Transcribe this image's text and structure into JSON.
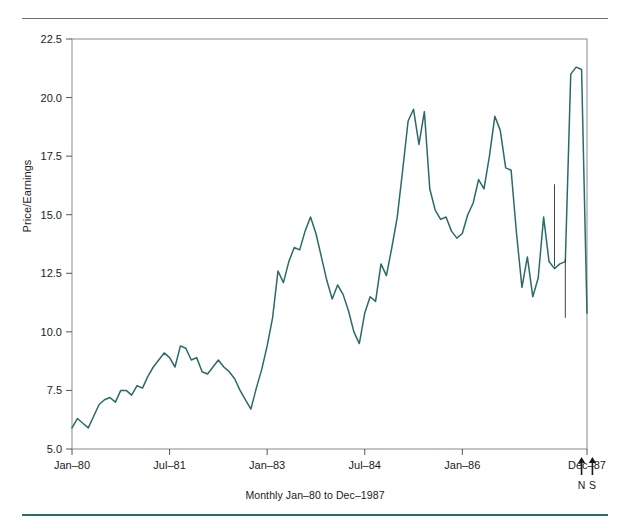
{
  "figure": {
    "top_text_remnant": "",
    "caption": "Monthly Jan–80 to Dec–1987",
    "accent_color": "#2a6f6c",
    "line_color": "#2a6b68",
    "rule_color": "#6e6e6e"
  },
  "axes": {
    "ylabel": "Price/Earnings",
    "yticks": [
      "5.0",
      "7.5",
      "10.0",
      "12.5",
      "15.0",
      "17.5",
      "20.0",
      "22.5"
    ],
    "xticks": [
      "Jan–80",
      "Jul–81",
      "Jan–83",
      "Jul–84",
      "Jan–86",
      "Dec–87"
    ]
  },
  "annotations": [
    {
      "name": "arrow-n",
      "label": "N",
      "x_value": 94
    },
    {
      "name": "arrow-s",
      "label": "S",
      "x_value": 96
    }
  ],
  "chart_data": {
    "type": "line",
    "title": "",
    "subtitle": "",
    "xlabel": "Monthly Jan–80 to Dec–1987",
    "ylabel": "Price/Earnings",
    "ylim": [
      5.0,
      22.5
    ],
    "yticks": [
      5.0,
      7.5,
      10.0,
      12.5,
      15.0,
      17.5,
      20.0,
      22.5
    ],
    "grid": false,
    "legend": "none",
    "x_tick_labels": [
      "Jan–80",
      "Jul–81",
      "Jan–83",
      "Jul–84",
      "Jan–86",
      "Dec–87"
    ],
    "x_tick_indices": [
      0,
      18,
      36,
      54,
      72,
      95
    ],
    "x_start": "Jan-1980",
    "x_end": "Dec-1987",
    "n_points": 96,
    "series": [
      {
        "name": "Price/Earnings",
        "color": "#2a6b68",
        "values": [
          5.9,
          6.3,
          6.1,
          5.9,
          6.4,
          6.9,
          7.1,
          7.2,
          7.0,
          7.5,
          7.5,
          7.3,
          7.7,
          7.6,
          8.1,
          8.5,
          8.8,
          9.1,
          8.9,
          8.5,
          9.4,
          9.3,
          8.8,
          8.9,
          8.3,
          8.2,
          8.5,
          8.8,
          8.5,
          8.3,
          8.0,
          7.5,
          7.1,
          6.7,
          7.6,
          8.4,
          9.4,
          10.6,
          12.6,
          12.1,
          13.0,
          13.6,
          13.5,
          14.3,
          14.9,
          14.2,
          13.2,
          12.2,
          11.4,
          12.0,
          11.6,
          10.9,
          10.0,
          9.5,
          10.8,
          11.5,
          11.3,
          12.9,
          12.4,
          13.6,
          14.9,
          16.9,
          19.0,
          19.5,
          18.0,
          19.4,
          16.1,
          15.2,
          14.8,
          14.9,
          14.3,
          14.0,
          14.2,
          15.0,
          15.5,
          16.5,
          16.1,
          17.5,
          19.2,
          18.6,
          17.0,
          16.9,
          14.2,
          11.9,
          13.2,
          11.5,
          12.3,
          14.9,
          13.0,
          12.7,
          12.9,
          13.0,
          21.0,
          21.3,
          21.2,
          10.8
        ]
      }
    ],
    "markers": [
      {
        "name": "vertical-tick-1",
        "x_value": 89,
        "y_low": 12.8,
        "y_high": 16.3
      },
      {
        "name": "vertical-tick-2",
        "x_value": 91,
        "y_low": 10.6,
        "y_high": 13.1
      }
    ]
  }
}
